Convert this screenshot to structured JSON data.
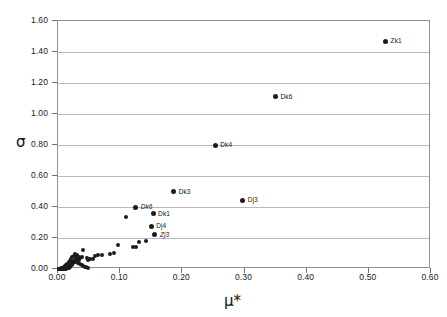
{
  "chart_data": {
    "type": "scatter",
    "title": "",
    "xlabel": "μ*",
    "ylabel": "σ",
    "xlim": [
      0.0,
      0.6
    ],
    "ylim": [
      0.0,
      1.6
    ],
    "grid": "horizontal",
    "legend": "none",
    "xticks": [
      "0.00",
      "0.10",
      "0.20",
      "0.30",
      "0.40",
      "0.50",
      "0.60"
    ],
    "yticks": [
      "0.00",
      "0.20",
      "0.40",
      "0.60",
      "0.80",
      "1.00",
      "1.20",
      "1.40",
      "1.60"
    ],
    "xtick_values": [
      0.0,
      0.1,
      0.2,
      0.3,
      0.4,
      0.5,
      0.6
    ],
    "ytick_values": [
      0.0,
      0.2,
      0.4,
      0.6,
      0.8,
      1.0,
      1.2,
      1.4,
      1.6
    ],
    "marker_color": "#1c1c1c",
    "grid_color": "#b9b9b9",
    "frame_color": "#8f8f8f",
    "labeled_points": [
      {
        "label": "Zk1",
        "x": 0.527,
        "y": 1.47,
        "italic": false
      },
      {
        "label": "Dk6",
        "x": 0.35,
        "y": 1.11,
        "italic": false
      },
      {
        "label": "Dk4",
        "x": 0.253,
        "y": 0.8,
        "italic": false
      },
      {
        "label": "Dk3",
        "x": 0.186,
        "y": 0.498,
        "italic": false
      },
      {
        "label": "Dj3",
        "x": 0.297,
        "y": 0.445,
        "italic": false
      },
      {
        "label": "Dk6",
        "x": 0.125,
        "y": 0.398,
        "italic": true
      },
      {
        "label": "Dk1",
        "x": 0.153,
        "y": 0.358,
        "italic": false
      },
      {
        "label": "Dj4",
        "x": 0.15,
        "y": 0.277,
        "italic": false
      },
      {
        "label": "Zj3",
        "x": 0.156,
        "y": 0.222,
        "italic": true
      }
    ],
    "unlabeled_points": [
      {
        "x": 0.109,
        "y": 0.338
      },
      {
        "x": 0.141,
        "y": 0.183
      },
      {
        "x": 0.131,
        "y": 0.176
      },
      {
        "x": 0.126,
        "y": 0.145
      },
      {
        "x": 0.121,
        "y": 0.141
      },
      {
        "x": 0.096,
        "y": 0.154
      },
      {
        "x": 0.083,
        "y": 0.097
      },
      {
        "x": 0.09,
        "y": 0.104
      },
      {
        "x": 0.07,
        "y": 0.092
      },
      {
        "x": 0.064,
        "y": 0.09
      },
      {
        "x": 0.06,
        "y": 0.084
      },
      {
        "x": 0.057,
        "y": 0.064
      },
      {
        "x": 0.052,
        "y": 0.062
      },
      {
        "x": 0.049,
        "y": 0.056
      },
      {
        "x": 0.046,
        "y": 0.07
      },
      {
        "x": 0.041,
        "y": 0.122
      },
      {
        "x": 0.038,
        "y": 0.075
      },
      {
        "x": 0.036,
        "y": 0.068
      },
      {
        "x": 0.034,
        "y": 0.08
      },
      {
        "x": 0.033,
        "y": 0.061
      },
      {
        "x": 0.031,
        "y": 0.072
      },
      {
        "x": 0.03,
        "y": 0.055
      },
      {
        "x": 0.029,
        "y": 0.064
      },
      {
        "x": 0.028,
        "y": 0.048
      },
      {
        "x": 0.027,
        "y": 0.059
      },
      {
        "x": 0.026,
        "y": 0.042
      },
      {
        "x": 0.025,
        "y": 0.051
      },
      {
        "x": 0.024,
        "y": 0.036
      },
      {
        "x": 0.024,
        "y": 0.046
      },
      {
        "x": 0.023,
        "y": 0.03
      },
      {
        "x": 0.022,
        "y": 0.04
      },
      {
        "x": 0.022,
        "y": 0.025
      },
      {
        "x": 0.021,
        "y": 0.034
      },
      {
        "x": 0.02,
        "y": 0.02
      },
      {
        "x": 0.02,
        "y": 0.029
      },
      {
        "x": 0.019,
        "y": 0.016
      },
      {
        "x": 0.019,
        "y": 0.024
      },
      {
        "x": 0.018,
        "y": 0.012
      },
      {
        "x": 0.018,
        "y": 0.02
      },
      {
        "x": 0.017,
        "y": 0.009
      },
      {
        "x": 0.017,
        "y": 0.017
      },
      {
        "x": 0.016,
        "y": 0.007
      },
      {
        "x": 0.016,
        "y": 0.014
      },
      {
        "x": 0.015,
        "y": 0.005
      },
      {
        "x": 0.015,
        "y": 0.012
      },
      {
        "x": 0.014,
        "y": 0.004
      },
      {
        "x": 0.014,
        "y": 0.01
      },
      {
        "x": 0.013,
        "y": 0.003
      },
      {
        "x": 0.013,
        "y": 0.008
      },
      {
        "x": 0.012,
        "y": 0.003
      },
      {
        "x": 0.012,
        "y": 0.007
      },
      {
        "x": 0.011,
        "y": 0.002
      },
      {
        "x": 0.011,
        "y": 0.006
      },
      {
        "x": 0.01,
        "y": 0.002
      },
      {
        "x": 0.01,
        "y": 0.005
      },
      {
        "x": 0.009,
        "y": 0.002
      },
      {
        "x": 0.009,
        "y": 0.004
      },
      {
        "x": 0.008,
        "y": 0.001
      },
      {
        "x": 0.008,
        "y": 0.004
      },
      {
        "x": 0.007,
        "y": 0.001
      },
      {
        "x": 0.007,
        "y": 0.003
      },
      {
        "x": 0.006,
        "y": 0.001
      },
      {
        "x": 0.006,
        "y": 0.003
      },
      {
        "x": 0.005,
        "y": 0.001
      },
      {
        "x": 0.005,
        "y": 0.002
      },
      {
        "x": 0.004,
        "y": 0.001
      },
      {
        "x": 0.004,
        "y": 0.002
      },
      {
        "x": 0.003,
        "y": 0.001
      },
      {
        "x": 0.003,
        "y": 0.002
      },
      {
        "x": 0.002,
        "y": 0.001
      },
      {
        "x": 0.002,
        "y": 0.001
      },
      {
        "x": 0.001,
        "y": 0.001
      },
      {
        "x": 0.001,
        "y": 0.0
      },
      {
        "x": 0.03,
        "y": 0.09
      },
      {
        "x": 0.032,
        "y": 0.036
      },
      {
        "x": 0.035,
        "y": 0.03
      },
      {
        "x": 0.038,
        "y": 0.024
      },
      {
        "x": 0.04,
        "y": 0.018
      },
      {
        "x": 0.043,
        "y": 0.014
      },
      {
        "x": 0.045,
        "y": 0.011
      },
      {
        "x": 0.048,
        "y": 0.008
      },
      {
        "x": 0.026,
        "y": 0.086
      },
      {
        "x": 0.028,
        "y": 0.094
      },
      {
        "x": 0.023,
        "y": 0.078
      },
      {
        "x": 0.021,
        "y": 0.066
      },
      {
        "x": 0.019,
        "y": 0.054
      },
      {
        "x": 0.017,
        "y": 0.044
      },
      {
        "x": 0.015,
        "y": 0.034
      },
      {
        "x": 0.013,
        "y": 0.026
      },
      {
        "x": 0.011,
        "y": 0.019
      },
      {
        "x": 0.009,
        "y": 0.013
      },
      {
        "x": 0.007,
        "y": 0.009
      },
      {
        "x": 0.005,
        "y": 0.006
      }
    ]
  }
}
